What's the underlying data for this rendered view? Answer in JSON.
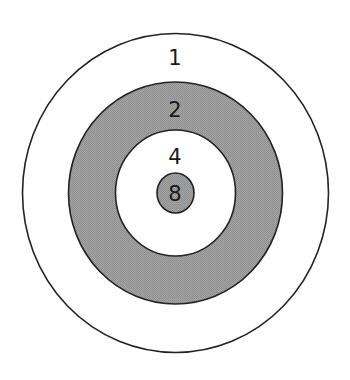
{
  "diagram": {
    "type": "concentric-target",
    "center": [
      175.5,
      193
    ],
    "colors": {
      "stroke": "#222222",
      "white": "#ffffff",
      "gray": "#9a9a9a"
    },
    "rings": [
      {
        "label": "1",
        "fill": "white",
        "rx": 153,
        "ry": 159.5,
        "label_y": 58
      },
      {
        "label": "2",
        "fill": "gray",
        "rx": 107,
        "ry": 111,
        "label_y": 110
      },
      {
        "label": "4",
        "fill": "white",
        "rx": 60,
        "ry": 63,
        "label_y": 157
      },
      {
        "label": "8",
        "fill": "gray",
        "rx": 18.5,
        "ry": 20,
        "label_y": 194
      }
    ]
  }
}
